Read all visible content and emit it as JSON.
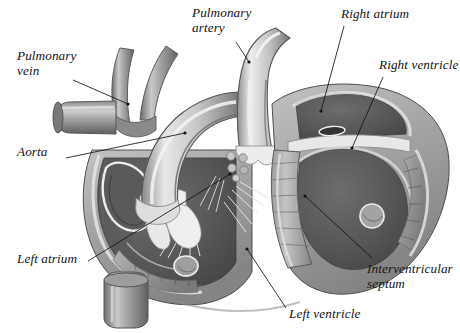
{
  "figure": {
    "kind": "anatomical-illustration",
    "style": "grayscale pencil/airbrush medical illustration on white background",
    "background_color": "#ffffff",
    "ink_color": "#131313"
  },
  "palette": {
    "paper": "#ffffff",
    "line": "#131313",
    "chamber_dark": "#5e5e5e",
    "chamber_darker": "#4a4a4a",
    "muscle_mid": "#8f8f8f",
    "muscle_light": "#b6b6b6",
    "highlight": "#e4e4e4",
    "vessel_light": "#d2d2d2",
    "vessel_mid": "#9b9b9b",
    "vessel_dark": "#6d6d6d",
    "valve_white": "#efefef",
    "outline": "#3c3c3c"
  },
  "labels": [
    {
      "id": "pulmonary-vein",
      "text": "Pulmonary\nvein",
      "lines": [
        "Pulmonary",
        "vein"
      ],
      "x": 17,
      "y": 48,
      "align": "left"
    },
    {
      "id": "pulmonary-artery",
      "text": "Pulmonary\nartery",
      "lines": [
        "Pulmonary",
        "artery"
      ],
      "x": 192,
      "y": 5,
      "align": "left"
    },
    {
      "id": "right-atrium",
      "text": "Right atrium",
      "lines": [
        "Right atrium"
      ],
      "x": 341,
      "y": 6,
      "align": "left"
    },
    {
      "id": "right-ventricle",
      "text": "Right ventricle",
      "lines": [
        "Right ventricle"
      ],
      "x": 379,
      "y": 57,
      "align": "left"
    },
    {
      "id": "aorta",
      "text": "Aorta",
      "lines": [
        "Aorta"
      ],
      "x": 17,
      "y": 144,
      "align": "left"
    },
    {
      "id": "left-atrium",
      "text": "Left atrium",
      "lines": [
        "Left atrium"
      ],
      "x": 17,
      "y": 251,
      "align": "left"
    },
    {
      "id": "left-ventricle",
      "text": "Left ventricle",
      "lines": [
        "Left ventricle"
      ],
      "x": 289,
      "y": 306,
      "align": "left"
    },
    {
      "id": "interventricular-septum",
      "text": "Interventricular\nseptum",
      "lines": [
        "Interventricular",
        "septum"
      ],
      "x": 367,
      "y": 261,
      "align": "left"
    }
  ],
  "leader_lines": [
    {
      "id": "leader-pulmonary-vein",
      "from_label": "pulmonary-vein",
      "x1": 73,
      "y1": 80,
      "x2": 128,
      "y2": 104,
      "dot": true
    },
    {
      "id": "leader-pulmonary-artery",
      "from_label": "pulmonary-artery",
      "x1": 236,
      "y1": 42,
      "x2": 249,
      "y2": 62,
      "dot": true
    },
    {
      "id": "leader-right-atrium",
      "from_label": "right-atrium",
      "x1": 344,
      "y1": 26,
      "x2": 321,
      "y2": 111,
      "dot": true
    },
    {
      "id": "leader-right-ventricle",
      "from_label": "right-ventricle",
      "x1": 383,
      "y1": 77,
      "x2": 352,
      "y2": 148,
      "dot": true
    },
    {
      "id": "leader-aorta",
      "from_label": "aorta",
      "x1": 66,
      "y1": 158,
      "x2": 185,
      "y2": 133,
      "dot": true
    },
    {
      "id": "leader-left-atrium",
      "from_label": "left-atrium",
      "x1": 88,
      "y1": 261,
      "x2": 230,
      "y2": 174,
      "dot": true
    },
    {
      "id": "leader-left-ventricle",
      "from_label": "left-ventricle",
      "x1": 286,
      "y1": 308,
      "x2": 247,
      "y2": 249,
      "dot": true
    },
    {
      "id": "leader-interventricular-septum",
      "from_label": "interventricular-septum",
      "x1": 372,
      "y1": 258,
      "x2": 305,
      "y2": 196,
      "dot": true
    }
  ],
  "structures": [
    {
      "id": "aortic-arch",
      "name": "Aorta (ascending aorta and arch)"
    },
    {
      "id": "brachiocephalic-vessels",
      "name": "Great vessels branching from arch"
    },
    {
      "id": "pulmonary-vein-stub",
      "name": "Pulmonary vein"
    },
    {
      "id": "pulmonary-trunk",
      "name": "Pulmonary artery trunk"
    },
    {
      "id": "right-atrium-chamber",
      "name": "Right atrium"
    },
    {
      "id": "right-ventricle-chamber",
      "name": "Right ventricle"
    },
    {
      "id": "left-atrium-chamber",
      "name": "Left atrium"
    },
    {
      "id": "left-ventricle-chamber",
      "name": "Left ventricle"
    },
    {
      "id": "interventricular-septum-wall",
      "name": "Interventricular septum"
    },
    {
      "id": "mitral-valve",
      "name": "Mitral valve leaflets and chordae tendineae"
    },
    {
      "id": "tricuspid-valve",
      "name": "Tricuspid valve leaflets and chordae tendineae"
    },
    {
      "id": "papillary-muscle",
      "name": "Papillary muscle"
    },
    {
      "id": "trabeculae",
      "name": "Trabeculae carneae (ridged ventricular wall)"
    },
    {
      "id": "inferior-vessel-stub",
      "name": "Inferior vessel stump"
    }
  ]
}
